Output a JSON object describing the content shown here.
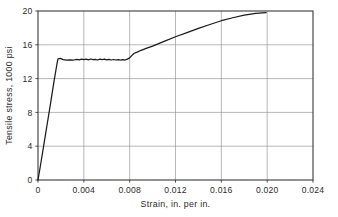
{
  "chart_data": {
    "type": "line",
    "title": "",
    "subtitle": "",
    "xlabel": "Strain, in. per in.",
    "ylabel": "Tensile stress, 1000 psi",
    "xlim": [
      0,
      0.024
    ],
    "ylim": [
      0,
      20
    ],
    "xticks": [
      0,
      0.004,
      0.008,
      0.012,
      0.016,
      0.02,
      0.024
    ],
    "xticklabels": [
      "0",
      "0.004",
      "0.008",
      "0.012",
      "0.016",
      "0.020",
      "0.024"
    ],
    "yticks": [
      0,
      4,
      8,
      12,
      16,
      20
    ],
    "yticklabels": [
      "0",
      "4",
      "8",
      "12",
      "16",
      "20"
    ],
    "grid": true,
    "legend": "none",
    "line_color": "#1a1a1a",
    "grid_color": "#9a9a9a",
    "axis_color": "#3a3a3a",
    "background_color": "#ffffff",
    "series": [
      {
        "name": "Tensile stress vs strain",
        "x": [
          0.0,
          0.0002,
          0.0005,
          0.0008,
          0.0011,
          0.0014,
          0.00155,
          0.00165,
          0.00175,
          0.00195,
          0.0022,
          0.0025,
          0.0028,
          0.0031,
          0.0034,
          0.0036,
          0.0038,
          0.004,
          0.0042,
          0.0044,
          0.0046,
          0.0048,
          0.005,
          0.0052,
          0.0054,
          0.0056,
          0.0058,
          0.006,
          0.0062,
          0.0064,
          0.0066,
          0.0068,
          0.007,
          0.0072,
          0.0074,
          0.0076,
          0.0078,
          0.008,
          0.0082,
          0.0084,
          0.0086,
          0.009,
          0.0095,
          0.01,
          0.011,
          0.012,
          0.013,
          0.014,
          0.015,
          0.016,
          0.017,
          0.018,
          0.019,
          0.0199
        ],
        "y": [
          0.0,
          1.6,
          4.1,
          6.6,
          9.1,
          11.7,
          12.9,
          13.7,
          14.35,
          14.4,
          14.25,
          14.2,
          14.22,
          14.2,
          14.28,
          14.22,
          14.3,
          14.25,
          14.3,
          14.22,
          14.32,
          14.25,
          14.28,
          14.2,
          14.3,
          14.24,
          14.3,
          14.22,
          14.28,
          14.2,
          14.26,
          14.2,
          14.25,
          14.2,
          14.24,
          14.2,
          14.3,
          14.45,
          14.75,
          15.0,
          15.1,
          15.35,
          15.6,
          15.85,
          16.4,
          16.95,
          17.45,
          17.95,
          18.4,
          18.85,
          19.2,
          19.5,
          19.72,
          19.8
        ]
      }
    ],
    "annotations": []
  },
  "figure": {
    "plot_left_px": 38,
    "plot_right_px": 313,
    "plot_top_px": 11,
    "plot_bottom_px": 180
  }
}
